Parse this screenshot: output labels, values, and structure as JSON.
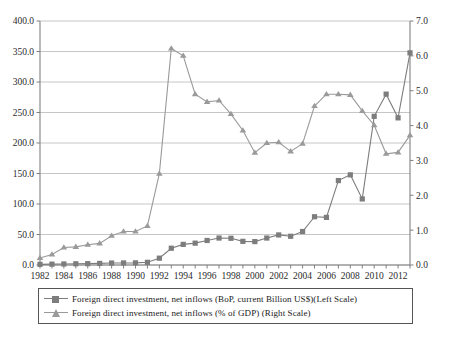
{
  "chart_data": {
    "type": "line",
    "title": "",
    "subtitle": "",
    "xlabel": "",
    "ylabel": "",
    "y2label": "",
    "grid": true,
    "legend_position": "bottom",
    "x": [
      1982,
      1983,
      1984,
      1985,
      1986,
      1987,
      1988,
      1989,
      1990,
      1991,
      1992,
      1993,
      1994,
      1995,
      1996,
      1997,
      1998,
      1999,
      2000,
      2001,
      2002,
      2003,
      2004,
      2005,
      2006,
      2007,
      2008,
      2009,
      2010,
      2011,
      2012,
      2013
    ],
    "xticks": [
      1982,
      1984,
      1986,
      1988,
      1990,
      1992,
      1994,
      1996,
      1998,
      2000,
      2002,
      2004,
      2006,
      2008,
      2010,
      2012
    ],
    "ylim": [
      0.0,
      400.0
    ],
    "yticks": [
      0.0,
      50.0,
      100.0,
      150.0,
      200.0,
      250.0,
      300.0,
      350.0,
      400.0
    ],
    "ytick_labels": [
      "0.0",
      "50.0",
      "100.0",
      "150.0",
      "200.0",
      "250.0",
      "300.0",
      "350.0",
      "400.0"
    ],
    "y2lim": [
      0.0,
      7.0
    ],
    "y2ticks": [
      0.0,
      1.0,
      2.0,
      3.0,
      4.0,
      5.0,
      6.0,
      7.0
    ],
    "y2tick_labels": [
      "0.0",
      "1.0",
      "2.0",
      "3.0",
      "4.0",
      "5.0",
      "6.0",
      "7.0"
    ],
    "series": [
      {
        "name": "Foreign direct investment, net inflows (BoP, current Billion US$)(Left Scale)",
        "axis": "left",
        "marker": "square",
        "color": "#7d7d7d",
        "values": [
          1.1,
          1.4,
          1.7,
          2.0,
          2.2,
          2.6,
          3.2,
          3.4,
          3.5,
          4.4,
          11.2,
          27.5,
          33.8,
          35.8,
          40.2,
          44.2,
          43.8,
          38.8,
          38.4,
          44.2,
          49.3,
          47.1,
          54.9,
          79.1,
          78.1,
          138.4,
          147.8,
          108.3,
          243.7,
          280.1,
          241.2,
          347.8
        ]
      },
      {
        "name": "Foreign direct investment, net inflows (% of GDP) (Right Scale)",
        "axis": "right",
        "marker": "triangle",
        "color": "#9a9a9a",
        "values": [
          0.2,
          0.3,
          0.5,
          0.52,
          0.58,
          0.62,
          0.84,
          0.96,
          0.96,
          1.12,
          2.62,
          6.21,
          6.0,
          4.9,
          4.68,
          4.72,
          4.33,
          3.86,
          3.22,
          3.5,
          3.52,
          3.26,
          3.48,
          4.56,
          4.9,
          4.9,
          4.88,
          4.42,
          4.01,
          3.19,
          3.23,
          3.72
        ]
      }
    ],
    "annotations": []
  },
  "legend": {
    "items": [
      {
        "label": "Foreign direct investment, net inflows (BoP, current Billion US$)(Left Scale)",
        "marker": "square-marker-icon",
        "color": "#7d7d7d"
      },
      {
        "label": "Foreign direct investment, net inflows (% of GDP) (Right Scale)",
        "marker": "triangle-marker-icon",
        "color": "#9a9a9a"
      }
    ]
  },
  "colors": {
    "series_square": "#7d7d7d",
    "series_triangle": "#9a9a9a",
    "grid": "#b8b8b8",
    "axis": "#808080",
    "text": "#2b2b2b",
    "legend_border": "#555555",
    "background": "#ffffff"
  }
}
